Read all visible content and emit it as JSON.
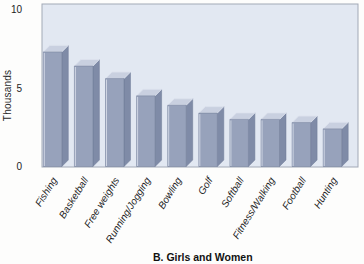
{
  "figure": {
    "caption": "B. Girls and Women",
    "ylabel": "Thousands"
  },
  "chart_data": {
    "type": "bar",
    "title": "B. Girls and Women",
    "xlabel": "",
    "ylabel": "Thousands",
    "categories": [
      "Fishing",
      "Basketball",
      "Free weights",
      "Running/Jogging",
      "Bowling",
      "Golf",
      "Softball",
      "Fitness/Walking",
      "Football",
      "Hunting"
    ],
    "values": [
      7.3,
      6.4,
      5.6,
      4.5,
      3.9,
      3.4,
      3.0,
      3.0,
      2.8,
      2.4
    ],
    "ylim": [
      0,
      10
    ],
    "yticks": [
      0,
      5,
      10
    ],
    "grid": false,
    "legend": false,
    "style_3d": true,
    "colors": {
      "bar_front": "#97a2bb",
      "bar_top": "#c9d0e0",
      "bar_side": "#7f8ba7",
      "bar_edge": "#6f7b97",
      "bar_highlight": "#dde2ee",
      "plot_bg": "#e2e8f2",
      "plot_border": "#a2a9b6",
      "text": "#1c1c1c"
    }
  }
}
